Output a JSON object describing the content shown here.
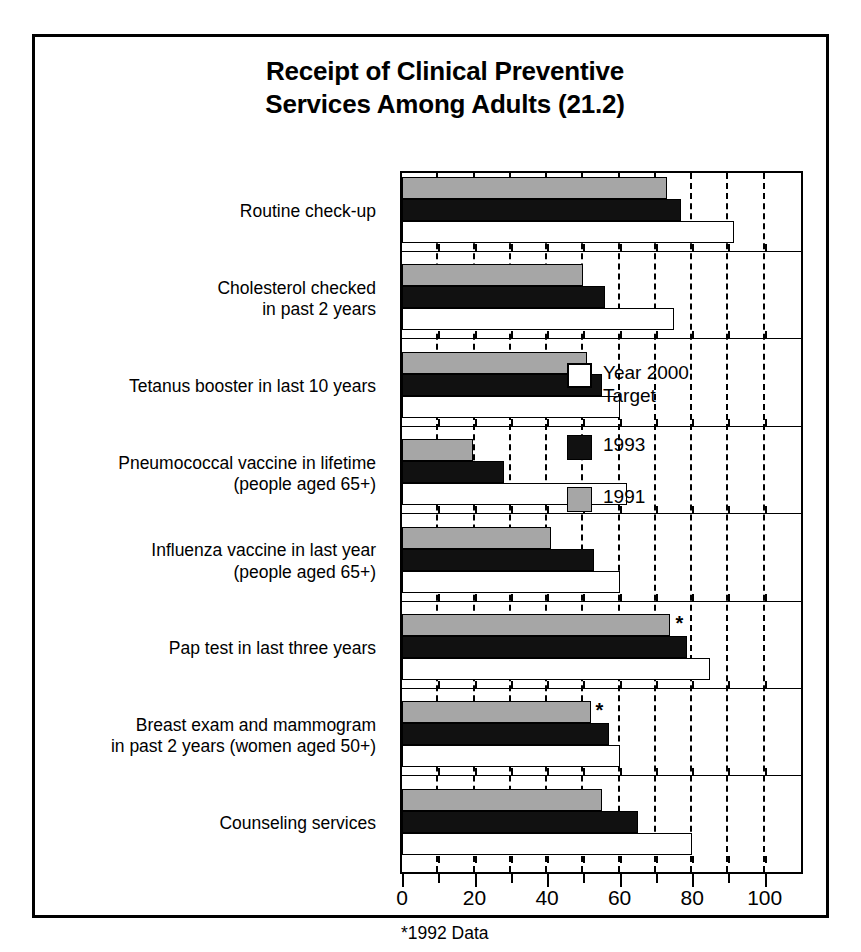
{
  "chart_data": {
    "type": "bar",
    "orientation": "horizontal",
    "title": "Receipt of Clinical Preventive Services Among Adults (21.2)",
    "title_line1": "Receipt of Clinical Preventive",
    "title_line2": "Services Among Adults (21.2)",
    "xlabel": "",
    "ylabel": "",
    "xlim": [
      0,
      110
    ],
    "xticks": [
      0,
      20,
      40,
      60,
      80,
      100
    ],
    "xtick_labels": [
      "0",
      "20",
      "40",
      "60",
      "80",
      "100"
    ],
    "minor_xticks": [
      10,
      30,
      50,
      70,
      90
    ],
    "grid": "vertical-dashed",
    "legend_position": "inside-right",
    "footnote": "*1992 Data",
    "categories": [
      "Routine check-up",
      "Cholesterol checked\nin past 2 years",
      "Tetanus booster in last 10 years",
      "Pneumococcal vaccine in lifetime\n(people aged 65+)",
      "Influenza vaccine in last year\n(people aged 65+)",
      "Pap test in last three years",
      "Breast exam and mammogram\nin past 2 years (women aged 50+)",
      "Counseling services"
    ],
    "series": [
      {
        "name": "Year 2000 Target",
        "key": "target",
        "color": "#ffffff",
        "values": [
          91.5,
          75,
          60,
          62,
          60,
          85,
          60,
          80
        ]
      },
      {
        "name": "1993",
        "key": "s1993",
        "color": "#111111",
        "values": [
          77,
          56,
          55,
          28,
          53,
          78.5,
          57,
          65
        ]
      },
      {
        "name": "1991",
        "key": "s1991",
        "color": "#a6a6a6",
        "values": [
          73,
          50,
          51,
          19.5,
          41,
          74,
          52,
          55
        ]
      }
    ],
    "annotations": [
      {
        "series": "1991",
        "category_index": 5,
        "marker": "*",
        "note": "1992 Data"
      },
      {
        "series": "1991",
        "category_index": 6,
        "marker": "*",
        "note": "1992 Data"
      }
    ]
  },
  "legend": {
    "entries": [
      {
        "label": "Year 2000\nTarget",
        "swatch": "target"
      },
      {
        "label": "1993",
        "swatch": "s1993"
      },
      {
        "label": "1991",
        "swatch": "s1991"
      }
    ]
  }
}
